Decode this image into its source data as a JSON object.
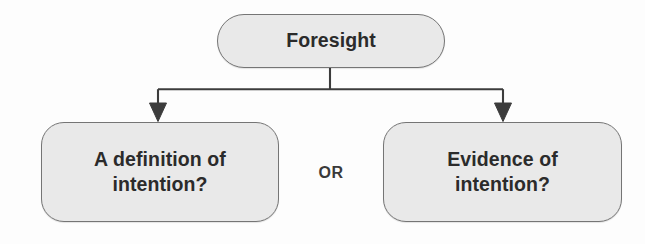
{
  "diagram": {
    "type": "tree-branch-flowchart",
    "background_color": "#fdfdfd",
    "node_fill_color": "#e9e9e9",
    "node_border_color": "#757575",
    "text_color": "#2b2b2b",
    "connector_color": "#3c3c3c",
    "root": {
      "id": "foresight",
      "label": "Foresight"
    },
    "branches": [
      {
        "id": "definition-of-intention",
        "label": "A definition of\nintention?"
      },
      {
        "id": "evidence-of-intention",
        "label": "Evidence of\nintention?"
      }
    ],
    "separator": {
      "label": "OR"
    }
  }
}
